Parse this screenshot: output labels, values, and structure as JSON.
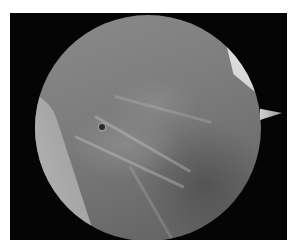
{
  "image": {
    "subject": "arthroscopic-view",
    "description": "Circular endoscopic/arthroscopic field of view on a black background showing grey fibrous tissue, a bright white cartilage surface in the upper right, and a light tissue band along the left edge",
    "colors": {
      "background": "#050505",
      "page": "#ffffff",
      "tissue": "#7d7d7d",
      "cartilage": "#e6e6e6"
    }
  }
}
